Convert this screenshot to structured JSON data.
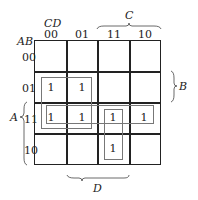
{
  "kmap": {
    "row_var_label": "AB",
    "col_var_label": "CD",
    "col_headers": [
      "00",
      "01",
      "11",
      "10"
    ],
    "row_headers": [
      "00",
      "01",
      "11",
      "10"
    ],
    "cells": [
      [
        "",
        "",
        "",
        ""
      ],
      [
        "1",
        "1",
        "",
        ""
      ],
      [
        "1",
        "1",
        "1",
        "1"
      ],
      [
        "",
        "",
        "1",
        ""
      ]
    ],
    "brace_labels": {
      "top": "C",
      "right": "B",
      "left": "A",
      "bottom": "D"
    },
    "groups": [
      {
        "rows": [
          "01",
          "11"
        ],
        "cols": [
          "00",
          "01"
        ]
      },
      {
        "rows": [
          "11"
        ],
        "cols": [
          "00",
          "01",
          "11",
          "10"
        ]
      },
      {
        "rows": [
          "11",
          "10"
        ],
        "cols": [
          "11"
        ]
      }
    ]
  }
}
